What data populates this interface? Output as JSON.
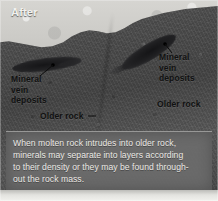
{
  "figure": {
    "title": "After",
    "labels": {
      "mineral_vein_left": "Mineral\nvein\ndeposits",
      "mineral_vein_right": "Mineral\nvein\ndeposits",
      "older_rock_left": "Older rock",
      "older_rock_right": "Older rock"
    },
    "caption": {
      "line1": "When molten rock intrudes into older rock,",
      "line2": "minerals may separate into layers according",
      "line3": "to their density or they may be found through-",
      "line4": "out the rock mass."
    },
    "colors": {
      "sky": "#d6d5d1",
      "rock": "#4b4b4b",
      "vein": "#1d1d1f",
      "caption_panel": "#6c6c6c",
      "caption_text": "#eceae6",
      "title_text": "#f2f2ef",
      "label_text": "#111111"
    }
  }
}
